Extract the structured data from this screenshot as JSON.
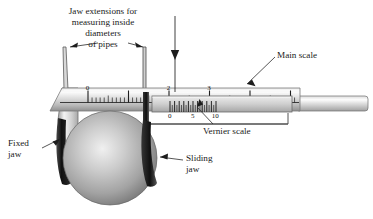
{
  "figure": {
    "background_color": "#ffffff"
  },
  "annotations": {
    "jaw_extensions_caption": "Jaw extensions for\nmeasuring inside\ndiameters\nof pipes",
    "main_scale_label": "Main scale",
    "vernier_scale_label": "Vernier scale",
    "fixed_jaw_label": "Fixed\njaw",
    "sliding_jaw_label": "Sliding\njaw"
  },
  "main_scale": {
    "labels": [
      "0",
      "2",
      "3"
    ],
    "label_positions": [
      0,
      2,
      3
    ],
    "major_ticks": [
      0,
      1,
      2,
      3,
      4,
      5,
      6
    ],
    "minor_per_major": 10,
    "start_x": 88,
    "unit_px": 40.5
  },
  "vernier_scale": {
    "labels": [
      "0",
      "5",
      "10"
    ],
    "label_positions": [
      0,
      5,
      10
    ],
    "divisions": 11,
    "start_x": 170,
    "unit_px": 4.6
  },
  "colors": {
    "beam_light": "#f2f2f2",
    "beam_mid": "#c8c8c8",
    "beam_dark": "#9a9a9a",
    "jaw_dark": "#1c1c1c",
    "sphere_light": "#e6e6e6",
    "sphere_mid": "#b4b4b4",
    "sphere_dark": "#7d7d7d",
    "line": "#333333",
    "text": "#1a1a1a"
  },
  "pointer_arrow": {
    "name": "reading-pointer-arrow",
    "from_y": 16,
    "to_y": 92,
    "x": 175
  }
}
